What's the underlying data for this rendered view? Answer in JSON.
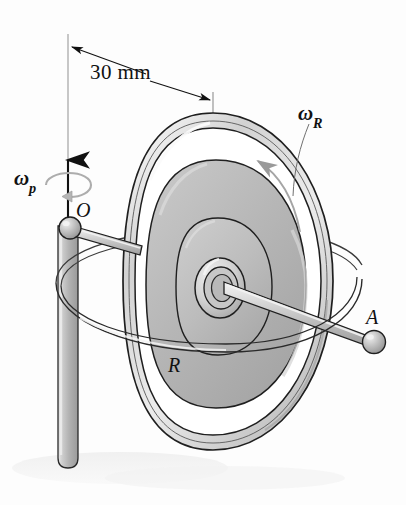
{
  "figure": {
    "type": "engineering-diagram",
    "background_color": "#fdfdfd",
    "ink_color": "#1a1a1a"
  },
  "labels": {
    "dimension": "30 mm",
    "omega_p": "ω",
    "omega_p_sub": "p",
    "omega_r": "ω",
    "omega_r_sub": "R",
    "point_o": "O",
    "point_a": "A",
    "disk_r": "R"
  },
  "annotations": {
    "dimension_value": 30,
    "dimension_unit": "mm",
    "precession_symbol": "ωp",
    "spin_symbol": "ωR",
    "pivot_point": "O",
    "ball_end_point": "A",
    "disk_radius_label": "R"
  },
  "colors": {
    "metal_light": "#f2f2f2",
    "metal_mid": "#cfcfcf",
    "metal_dark": "#8f8f8f",
    "disk_gray": "#b9b9b9",
    "disk_gray_dark": "#a2a2a2",
    "outline": "#1a1a1a",
    "arrow_gray": "#9a9a9a",
    "shadow": "#ededed"
  }
}
